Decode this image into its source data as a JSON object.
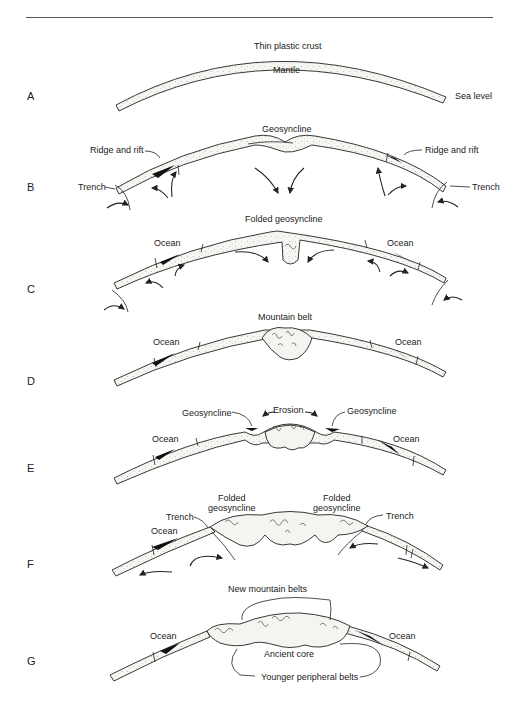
{
  "figure": {
    "panels": [
      {
        "letter": "A",
        "labels": {
          "top": "Thin plastic crust",
          "under": "Mantle",
          "right": "Sea level"
        }
      },
      {
        "letter": "B",
        "labels": {
          "center": "Geosyncline",
          "left_ridge": "Ridge and rift",
          "right_ridge": "Ridge and rift",
          "left_trench": "Trench",
          "right_trench": "Trench"
        }
      },
      {
        "letter": "C",
        "labels": {
          "center": "Folded geosyncline",
          "left_ocean": "Ocean",
          "right_ocean": "Ocean"
        }
      },
      {
        "letter": "D",
        "labels": {
          "center": "Mountain belt",
          "left_ocean": "Ocean",
          "right_ocean": "Ocean"
        }
      },
      {
        "letter": "E",
        "labels": {
          "left_geo": "Geosyncline",
          "center": "Erosion",
          "right_geo": "Geosyncline",
          "left_ocean": "Ocean",
          "right_ocean": "Ocean"
        }
      },
      {
        "letter": "F",
        "labels": {
          "left_folded_1": "Folded",
          "left_folded_2": "geosyncline",
          "right_folded_1": "Folded",
          "right_folded_2": "geosyncline",
          "left_trench": "Trench",
          "right_trench": "Trench",
          "left_ocean": "Ocean"
        }
      },
      {
        "letter": "G",
        "labels": {
          "top": "New mountain belts",
          "left_ocean": "Ocean",
          "right_ocean": "Ocean",
          "core": "Ancient core",
          "bottom": "Younger peripheral belts"
        }
      }
    ]
  }
}
